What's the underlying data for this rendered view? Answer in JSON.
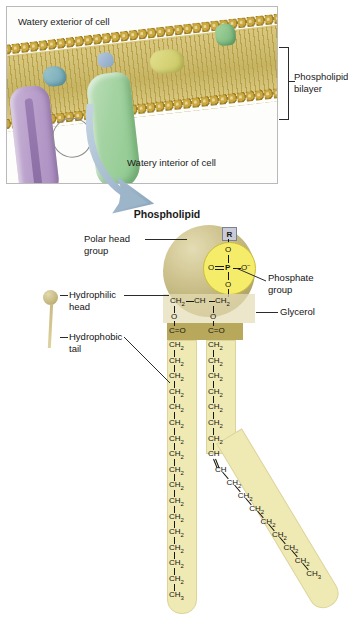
{
  "membrane_panel": {
    "exterior_label": "Watery exterior of cell",
    "interior_label": "Watery interior of cell",
    "bilayer_label": "Phospholipid bilayer",
    "proteins": [
      {
        "name": "channel-protein",
        "color": "#b99fcb"
      },
      {
        "name": "large-globular-protein",
        "color": "#a4d3a2"
      },
      {
        "name": "teal-surface-protein",
        "color": "#6fa6b3"
      },
      {
        "name": "blue-surface-protein",
        "color": "#8aa5c4"
      },
      {
        "name": "yellow-surface-protein",
        "color": "#c9c662"
      },
      {
        "name": "green-surface-protein",
        "color": "#72b377"
      }
    ],
    "head_color": "#caa83f",
    "tail_color": "#cdbc6e"
  },
  "molecule": {
    "title": "Phospholipid",
    "r_group": "R",
    "phosphate": {
      "top_oxygen": "O",
      "left_oxygen": "O",
      "center_atom": "P",
      "right_oxygen": "O",
      "bottom_oxygen": "O",
      "circle_color": "#f5ed6a"
    },
    "glycerol": {
      "c1": "CH",
      "c1_sub": "2",
      "c2": "CH",
      "c3": "CH",
      "c3_sub": "2",
      "ester_oxygen_left": "O",
      "ester_oxygen_right": "O"
    },
    "carbonyl_left": "C=O",
    "carbonyl_right": "C=O",
    "tail_left": {
      "name": "saturated-tail",
      "units": [
        "CH2",
        "CH2",
        "CH2",
        "CH2",
        "CH2",
        "CH2",
        "CH2",
        "CH2",
        "CH2",
        "CH2",
        "CH2",
        "CH2",
        "CH2",
        "CH2",
        "CH2",
        "CH2"
      ],
      "terminal": "CH3"
    },
    "tail_right": {
      "name": "unsaturated-tail",
      "upper_units": [
        "CH2",
        "CH2",
        "CH2",
        "CH2",
        "CH2",
        "CH2",
        "CH2"
      ],
      "double_bond": [
        "CH",
        "CH"
      ],
      "lower_units": [
        "CH2",
        "CH2",
        "CH2",
        "CH2",
        "CH2",
        "CH2",
        "CH2"
      ],
      "terminal": "CH3"
    },
    "head_color": "#cfc490",
    "tail_color": "#efe9b4"
  },
  "labels": {
    "polar_head_group": "Polar head group",
    "hydrophilic_head": "Hydrophilic head",
    "hydrophobic_tail": "Hydrophobic tail",
    "phosphate_group": "Phosphate group",
    "glycerol": "Glycerol"
  }
}
